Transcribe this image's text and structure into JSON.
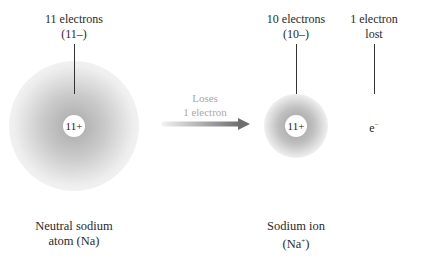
{
  "atom": {
    "top_label_line1": "11 electrons",
    "top_label_line2": "(11–)",
    "nucleus_charge": "11+",
    "bottom_label_line1": "Neutral sodium",
    "bottom_label_line2": "atom (Na)"
  },
  "transition": {
    "line1": "Loses",
    "line2": "1 electron"
  },
  "ion": {
    "top_label_line1": "10 electrons",
    "top_label_line2": "(10–)",
    "nucleus_charge": "11+",
    "bottom_label_line1": "Sodium ion",
    "bottom_label_line2_base": "(Na",
    "bottom_label_line2_sup": "+",
    "bottom_label_line2_end": ")"
  },
  "lost_electron": {
    "top_label_line1": "1 electron",
    "top_label_line2": "lost",
    "symbol_base": "e",
    "symbol_sup": "−"
  },
  "colors": {
    "glow": "#9a9a9a",
    "arrow_dark": "#6e6e6e",
    "arrow_light": "#f2f2f2",
    "text": "#2a2a2a",
    "arrow_text": "#aaaaaa"
  }
}
